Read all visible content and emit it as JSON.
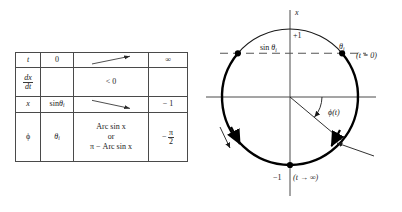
{
  "figure": {
    "panels": [
      "limit-table",
      "unit-circle-diagram"
    ]
  },
  "table": {
    "rows": [
      {
        "label": "t",
        "initial": "0",
        "middle": "",
        "middle_arrow": "arrow-up-right",
        "final": "∞"
      },
      {
        "label_num": "dx",
        "label_den": "dt",
        "initial": "",
        "middle": "< 0",
        "final": ""
      },
      {
        "label": "x",
        "initial_fn": "sin",
        "initial_sym": "θ",
        "initial_sub": "i",
        "middle": "",
        "middle_arrow": "arrow-down-right",
        "final": "− 1"
      },
      {
        "label": "ϕ",
        "initial_sym": "θ",
        "initial_sub": "i",
        "middle_line1": "Arc sin x",
        "middle_line2": "or",
        "middle_line3": "π − Arc sin x",
        "final_minus": "−",
        "final_num": "π",
        "final_den": "2"
      }
    ]
  },
  "diagram": {
    "axis_label_x": "x",
    "top_tick_label": "+1",
    "bottom_tick_label": "−1",
    "bottom_annotation": "(t → ∞)",
    "dashed_line_label_fn": "sin",
    "dashed_line_label_sym": "θ",
    "dashed_line_label_sub": "i",
    "point_label_sym": "θ",
    "point_label_sub": "i",
    "point_annotation": "(t = 0)",
    "angle_label": "ϕ(t)",
    "colors": {
      "stroke": "#1a1a1a",
      "thick_arc": "#000000",
      "dashed": "#555555",
      "axis": "#4a4a4a"
    },
    "geometry": {
      "center_x": 92,
      "center_y": 97,
      "radius": 68,
      "theta_i_degrees": 40,
      "phi_degrees": 40
    }
  }
}
